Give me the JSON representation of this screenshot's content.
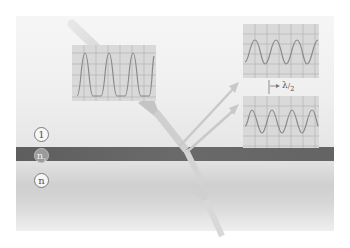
{
  "diagram": {
    "title": "",
    "media": {
      "upper": {
        "label": "1"
      },
      "film": {
        "label": "n",
        "subscript": "1"
      },
      "substrate": {
        "label": "n"
      }
    },
    "panels": {
      "incident_wave": {
        "cycles": 3,
        "description": "incident wave"
      },
      "reflected_wave_1": {
        "cycles": 3,
        "description": "wave reflected from film surface"
      },
      "reflected_wave_2": {
        "cycles": 3,
        "description": "wave reflected from substrate, shifted"
      }
    },
    "phase_shift_label": {
      "lambda": "λ",
      "divider": "/",
      "denominator": "2"
    },
    "colors": {
      "background": "#ffffff",
      "upper_medium": "#eeeeee",
      "film": "#646464",
      "substrate": "#d4d4d4",
      "panel": "#d9d9d9",
      "wave": "#8a8a8a",
      "ray": "#c8c8c8"
    }
  }
}
